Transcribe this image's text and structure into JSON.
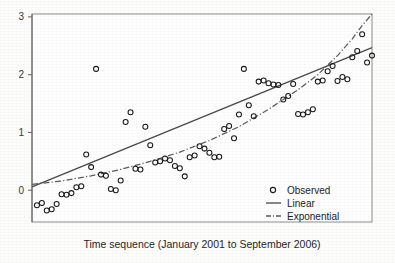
{
  "chart_data": {
    "type": "scatter",
    "title": "",
    "subtitle": "",
    "xlabel": "Time sequence (January 2001 to September 2006)",
    "ylabel": "",
    "xlim": [
      0,
      69
    ],
    "ylim": [
      -0.55,
      3.05
    ],
    "grid": false,
    "x_tick_labels": [],
    "y_ticks": [
      0,
      1,
      2,
      3
    ],
    "y_tick_labels": [
      "0",
      "1",
      "2",
      "3"
    ],
    "legend_position": "bottom-right",
    "legend": [
      {
        "label": "Observed",
        "marker": "open-circle",
        "style": "marker"
      },
      {
        "label": "Linear",
        "marker": "solid-line",
        "style": "line"
      },
      {
        "label": "Exponential",
        "marker": "dash-dot-line",
        "style": "line"
      }
    ],
    "colors": {
      "marker_stroke": "#1a1a1a",
      "linear_line": "#4a4a4a",
      "exponential_line": "#5a5a5a",
      "axis": "#707070",
      "background": "#fdfdfc",
      "text": "#1f1f1f"
    },
    "series": [
      {
        "name": "Observed",
        "marker": "open-circle",
        "x": [
          1,
          2,
          3,
          4,
          5,
          6,
          7,
          8,
          9,
          10,
          11,
          12,
          13,
          14,
          15,
          16,
          17,
          18,
          19,
          20,
          21,
          22,
          23,
          24,
          25,
          26,
          27,
          28,
          29,
          30,
          31,
          32,
          33,
          34,
          35,
          36,
          37,
          38,
          39,
          40,
          41,
          42,
          43,
          44,
          45,
          46,
          47,
          48,
          49,
          50,
          51,
          52,
          53,
          54,
          55,
          56,
          57,
          58,
          59,
          60,
          61,
          62,
          63,
          64,
          65,
          66,
          67,
          68,
          69
        ],
        "y": [
          -0.26,
          -0.22,
          -0.35,
          -0.33,
          -0.24,
          -0.07,
          -0.08,
          -0.05,
          0.05,
          0.07,
          0.62,
          0.4,
          2.1,
          0.27,
          0.25,
          0.02,
          0.0,
          0.17,
          1.18,
          1.35,
          0.37,
          0.36,
          1.1,
          0.78,
          0.48,
          0.5,
          0.55,
          0.52,
          0.42,
          0.38,
          0.24,
          0.57,
          0.6,
          0.76,
          0.72,
          0.65,
          0.57,
          0.58,
          1.06,
          1.11,
          0.9,
          1.31,
          2.1,
          1.47,
          1.28,
          1.88,
          1.9,
          1.85,
          1.83,
          1.82,
          1.57,
          1.63,
          1.84,
          1.32,
          1.31,
          1.35,
          1.4,
          1.88,
          1.9,
          2.06,
          2.15,
          1.89,
          1.96,
          1.92,
          2.3,
          2.41,
          2.7,
          2.21,
          2.33
        ]
      }
    ],
    "fits": [
      {
        "name": "Linear",
        "style": "solid",
        "start": {
          "x": 0,
          "y": 0.06
        },
        "end": {
          "x": 69,
          "y": 2.47
        }
      },
      {
        "name": "Exponential",
        "style": "dash-dot",
        "description": "Exponential fit starting near 0.1, sagging below the linear fit mid-range, then rising steeply and exiting the top of the plot frame near the right edge.",
        "points": [
          {
            "x": 0,
            "y": 0.1
          },
          {
            "x": 6,
            "y": 0.16
          },
          {
            "x": 12,
            "y": 0.25
          },
          {
            "x": 18,
            "y": 0.36
          },
          {
            "x": 24,
            "y": 0.5
          },
          {
            "x": 30,
            "y": 0.66
          },
          {
            "x": 36,
            "y": 0.86
          },
          {
            "x": 42,
            "y": 1.1
          },
          {
            "x": 48,
            "y": 1.4
          },
          {
            "x": 54,
            "y": 1.74
          },
          {
            "x": 58,
            "y": 2.0
          },
          {
            "x": 62,
            "y": 2.33
          },
          {
            "x": 65,
            "y": 2.62
          },
          {
            "x": 67,
            "y": 2.85
          },
          {
            "x": 69,
            "y": 3.05
          }
        ]
      }
    ]
  },
  "caption": {
    "x_axis_text": "Time sequence (January 2001 to September 2006)"
  }
}
